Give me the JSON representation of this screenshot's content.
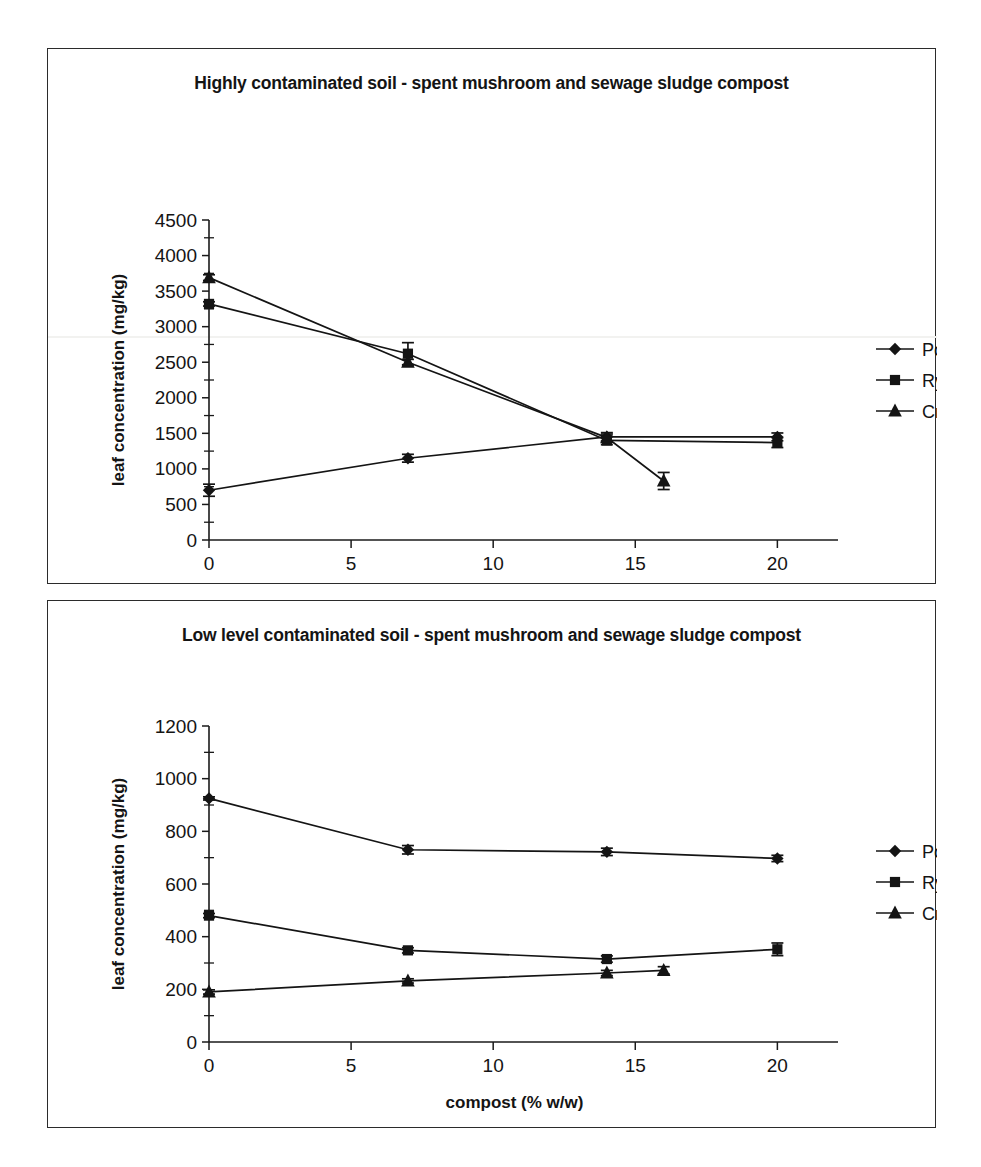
{
  "figure": {
    "panels": [
      {
        "id": "highly-contaminated",
        "title": "Highly contaminated soil - spent mushroom and sewage sludge compost"
      },
      {
        "id": "low-level-contaminated",
        "title": "Low level contaminated soil - spent mushroom and sewage sludge compost"
      }
    ]
  },
  "chart_data": [
    {
      "type": "line",
      "title": "Highly contaminated soil - spent mushroom and sewage sludge compost",
      "xlabel": "compost (% w/w)",
      "ylabel": "leaf concentration (mg/kg)",
      "xlim": [
        0,
        21.5
      ],
      "ylim": [
        0,
        4500
      ],
      "xticks": [
        0,
        5,
        10,
        15,
        20
      ],
      "yticks": [
        0,
        500,
        1000,
        1500,
        2000,
        2500,
        3000,
        3500,
        4000,
        4500
      ],
      "grid": false,
      "legend_position": "right",
      "series": [
        {
          "name": "Poplar",
          "marker": "diamond",
          "x": [
            0,
            7,
            14,
            20
          ],
          "values": [
            700,
            1150,
            1450,
            1450
          ],
          "errors": [
            85,
            55,
            60,
            55
          ]
        },
        {
          "name": "Rye",
          "marker": "square",
          "x": [
            0,
            7,
            14,
            20
          ],
          "values": [
            3320,
            2620,
            1400,
            1370
          ],
          "errors": [
            30,
            155,
            60,
            70
          ]
        },
        {
          "name": "Cress",
          "marker": "triangle",
          "x": [
            0,
            7,
            14,
            16
          ],
          "values": [
            3690,
            2500,
            1440,
            830
          ],
          "errors": [
            40,
            40,
            50,
            120
          ]
        }
      ]
    },
    {
      "type": "line",
      "title": "Low level contaminated soil - spent mushroom and sewage sludge compost",
      "xlabel": "compost (% w/w)",
      "ylabel": "leaf concentration (mg/kg)",
      "xlim": [
        0,
        21.5
      ],
      "ylim": [
        0,
        1200
      ],
      "xticks": [
        0,
        5,
        10,
        15,
        20
      ],
      "yticks": [
        0,
        200,
        400,
        600,
        800,
        1000,
        1200
      ],
      "grid": false,
      "legend_position": "right",
      "series": [
        {
          "name": "Poplar",
          "marker": "diamond",
          "x": [
            0,
            7,
            14,
            20
          ],
          "values": [
            925,
            730,
            722,
            697
          ],
          "errors": [
            6,
            16,
            14,
            12
          ]
        },
        {
          "name": "Rye",
          "marker": "square",
          "x": [
            0,
            7,
            14,
            20
          ],
          "values": [
            480,
            348,
            315,
            352
          ],
          "errors": [
            8,
            10,
            12,
            24
          ]
        },
        {
          "name": "Cress",
          "marker": "triangle",
          "x": [
            0,
            7,
            14,
            16
          ],
          "values": [
            190,
            232,
            262,
            272
          ],
          "errors": [
            8,
            8,
            10,
            14
          ]
        }
      ]
    }
  ],
  "legend": {
    "entries": [
      {
        "label": "Poplar",
        "marker": "diamond"
      },
      {
        "label": "Rye",
        "marker": "square"
      },
      {
        "label": "Cress",
        "marker": "triangle"
      }
    ]
  },
  "colors": {
    "ink": "#141414",
    "axis": "#1a1a1a",
    "panel_border": "#2b2b2b",
    "background": "#ffffff"
  }
}
